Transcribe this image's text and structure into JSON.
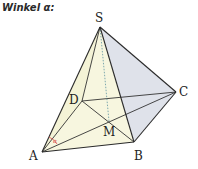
{
  "title": "Winkel α:",
  "diagram": {
    "type": "square pyramid",
    "vertices": {
      "S": {
        "label": "S",
        "x": 100,
        "y": 27,
        "lx": 95,
        "ly": 22
      },
      "A": {
        "label": "A",
        "x": 42,
        "y": 152,
        "lx": 29,
        "ly": 160
      },
      "B": {
        "label": "B",
        "x": 134,
        "y": 142,
        "lx": 134,
        "ly": 160
      },
      "C": {
        "label": "C",
        "x": 176,
        "y": 92,
        "lx": 179,
        "ly": 96
      },
      "D": {
        "label": "D",
        "x": 82,
        "y": 101,
        "lx": 69,
        "ly": 104
      },
      "M": {
        "label": "M",
        "x": 109,
        "y": 121,
        "lx": 103,
        "ly": 136
      }
    },
    "angle": {
      "label": "α",
      "vertex": "A",
      "color": "#d9534f"
    },
    "colors": {
      "front_face": "#f7f6df",
      "right_face": "#dfe2ea",
      "edge": "#333333",
      "height_line": "#6f9fa8"
    }
  }
}
